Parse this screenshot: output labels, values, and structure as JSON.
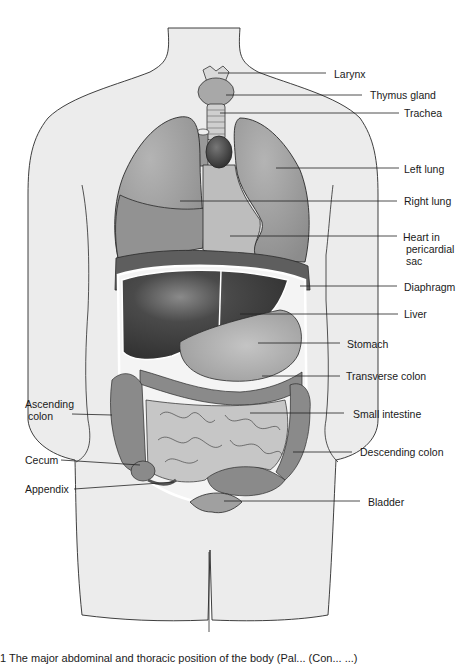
{
  "figure": {
    "type": "anatomical-diagram",
    "colors": {
      "background": "#ffffff",
      "body_fill": "#ececec",
      "outline": "#2a2a2a",
      "lung": "#9a9a9a",
      "lung_lower": "#8e8e8e",
      "heart_sac": "#bdbdbd",
      "heart": "#4a4a4a",
      "diaphragm": "#5c5c5c",
      "liver": "#3e3e3e",
      "stomach": "#a8a8a8",
      "colon": "#8a8a8a",
      "small_intestine": "#c6c6c6",
      "bladder": "#9c9c9c",
      "larynx": "#d8d8d8",
      "thyroid": "#a6a6a6",
      "leader_line": "#222222"
    }
  },
  "labels": {
    "larynx": "Larynx",
    "thymus": "Thymus gland",
    "trachea": "Trachea",
    "left_lung": "Left lung",
    "right_lung": "Right lung",
    "heart": "Heart in\n pericardial\n sac",
    "diaphragm": "Diaphragm",
    "liver": "Liver",
    "stomach": "Stomach",
    "transverse_colon": "Transverse colon",
    "small_intestine": "Small intestine",
    "descending_colon": "Descending colon",
    "bladder": "Bladder",
    "ascending_colon": "Ascending\n colon",
    "cecum": "Cecum",
    "appendix": "Appendix"
  },
  "caption": "1  The major abdominal and thoracic position of the body (Pal...  (Con...  ...)"
}
